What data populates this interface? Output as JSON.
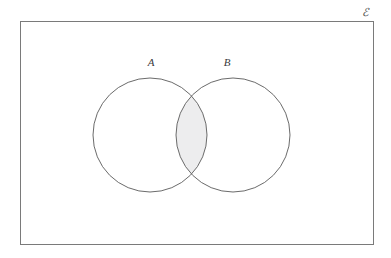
{
  "diagram": {
    "type": "venn-two-set",
    "universe": {
      "symbol": "ℰ",
      "name": "universal-set",
      "position": {
        "x": 365,
        "y": 16
      }
    },
    "rectangle": {
      "name": "universal-set-rectangle",
      "x": 20,
      "y": 21,
      "width": 353,
      "height": 223,
      "stroke": "#7a7a7a",
      "fill": "#ffffff",
      "stroke_width": 1
    },
    "sets": [
      {
        "label": "A",
        "name": "set-a",
        "cx": 150,
        "cy": 135,
        "r": 57,
        "stroke": "#6b6b6b",
        "fill": "none",
        "label_position": {
          "x": 151,
          "y": 66
        }
      },
      {
        "label": "B",
        "name": "set-b",
        "cx": 233,
        "cy": 135,
        "r": 57,
        "stroke": "#6b6b6b",
        "fill": "none",
        "label_position": {
          "x": 227,
          "y": 66
        }
      }
    ],
    "shaded_region": {
      "name": "intersection-a-and-b",
      "description": "A intersect B",
      "fill": "#ededee",
      "stroke": "none"
    },
    "colors": {
      "background": "#ffffff",
      "outline": "#6b6b6b",
      "rectangle_outline": "#7a7a7a",
      "shading": "#ededee",
      "text": "#3a3a3a"
    }
  }
}
